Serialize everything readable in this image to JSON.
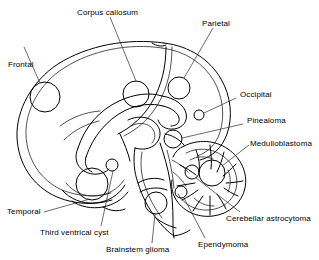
{
  "figure": {
    "type": "anatomical-line-diagram",
    "background_color": "#ffffff",
    "line_color": "#000000",
    "text_color": "#000000",
    "font_size_px": 8
  },
  "labels": {
    "corpus_callosum": "Corpus callosum",
    "parietal": "Parietal",
    "frontal": "Frontal",
    "occipital": "Occipital",
    "pinealoma": "Pinealoma",
    "medulloblastoma": "Medulloblastoma",
    "cerebellar_astrocytoma": "Cerebellar astrocytoma",
    "ependymoma": "Ependymoma",
    "brainstem_glioma": "Brainstem glioma",
    "third_ventrical_cyst": "Third ventrical cyst",
    "temporal": "Temporal"
  },
  "markers": [
    {
      "name": "frontal",
      "label": "Frontal",
      "cx": 45,
      "cy": 97,
      "r": 15
    },
    {
      "name": "corpus-callosum",
      "label": "Corpus callosum",
      "cx": 136,
      "cy": 94,
      "r": 13
    },
    {
      "name": "parietal",
      "label": "Parietal",
      "cx": 179,
      "cy": 88,
      "r": 11
    },
    {
      "name": "occipital",
      "label": "Occipital",
      "cx": 199,
      "cy": 115,
      "r": 5
    },
    {
      "name": "pinealoma",
      "label": "Pinealoma",
      "cx": 173,
      "cy": 139,
      "r": 9
    },
    {
      "name": "medulloblastoma",
      "label": "Medulloblastoma",
      "cx": 212,
      "cy": 173,
      "r": 13
    },
    {
      "name": "cerebellar-astrocytoma",
      "label": "Cerebellar astrocytoma",
      "cx": 192,
      "cy": 172,
      "r": 7
    },
    {
      "name": "ependymoma",
      "label": "Ependymoma",
      "cx": 181,
      "cy": 192,
      "r": 6
    },
    {
      "name": "brainstem-glioma",
      "label": "Brainstem glioma",
      "cx": 156,
      "cy": 203,
      "r": 11
    },
    {
      "name": "third-ventrical-cyst",
      "label": "Third ventrical cyst",
      "cx": 112,
      "cy": 165,
      "r": 6
    },
    {
      "name": "temporal",
      "label": "Temporal",
      "cx": 92,
      "cy": 184,
      "r": 16
    }
  ]
}
